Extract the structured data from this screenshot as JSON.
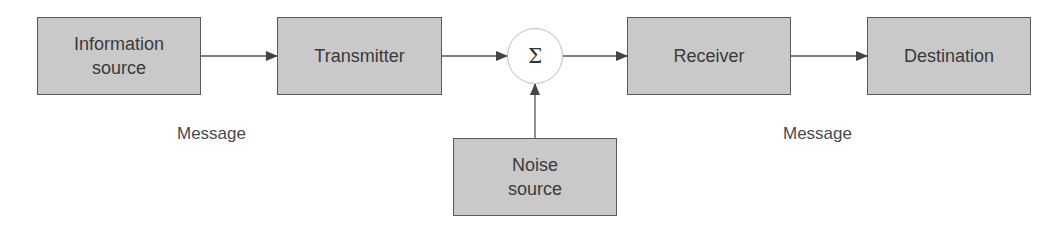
{
  "diagram": {
    "type": "block-diagram",
    "title": "",
    "colors": {
      "block_fill": "#c9c9c9",
      "block_border": "#5a5a5a",
      "text": "#3a3a3a",
      "arrow": "#444444",
      "summer_border": "#bdbdbd"
    },
    "blocks": {
      "information_source": {
        "label": "Information\nsource"
      },
      "transmitter": {
        "label": "Transmitter"
      },
      "receiver": {
        "label": "Receiver"
      },
      "destination": {
        "label": "Destination"
      },
      "noise_source": {
        "label": "Noise\nsource"
      }
    },
    "summer": {
      "symbol": "Σ"
    },
    "labels": {
      "message_left": "Message",
      "message_right": "Message"
    },
    "edges": [
      {
        "from": "information_source",
        "to": "transmitter"
      },
      {
        "from": "transmitter",
        "to": "summer"
      },
      {
        "from": "noise_source",
        "to": "summer"
      },
      {
        "from": "summer",
        "to": "receiver"
      },
      {
        "from": "receiver",
        "to": "destination"
      }
    ]
  }
}
